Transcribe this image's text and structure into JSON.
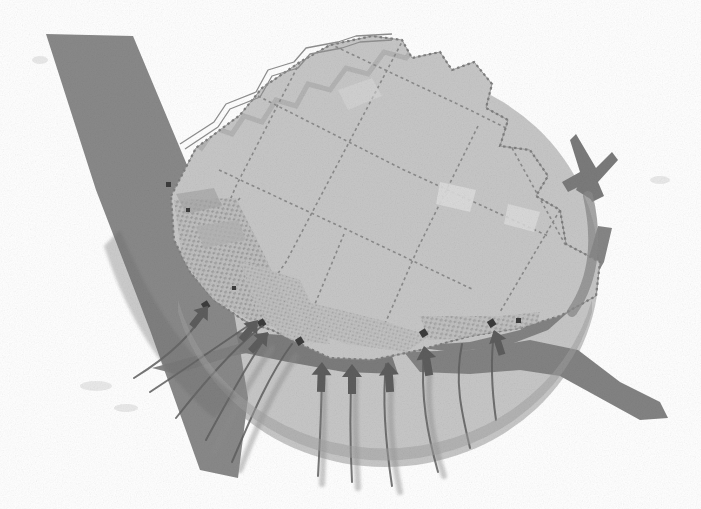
{
  "document": {
    "type": "analytical-urban-map",
    "title": "District Accessibility and Flow Diagram",
    "background_color": "#ffffff",
    "width": 701,
    "height": 509,
    "color_mode": "grayscale"
  },
  "palette": {
    "background": "#ffffff",
    "district_fill": "#c6c6c6",
    "district_fill_light": "#cfcfcf",
    "parcel_outline": "#8e8e8e",
    "corridor_band": "#858585",
    "corridor_band_dark": "#7b7b7b",
    "catchment_circle": "#a9a9a9",
    "flow_arrow": "#6f6f6f",
    "flow_line": "#5e5e5e",
    "building_texture": "#b0b0b0",
    "road_line": "#9a9a9a",
    "marker_dark": "#3a3a3a"
  },
  "layers": [
    {
      "id": "corridor",
      "name": "Transport / Water Corridor",
      "color": "#858585",
      "opacity": 0.95
    },
    {
      "id": "catchment",
      "name": "Catchment Radius Circle",
      "color": "#a9a9a9",
      "opacity": 0.72
    },
    {
      "id": "district",
      "name": "District Parcel Block",
      "color": "#c6c6c6",
      "opacity": 1
    },
    {
      "id": "flows",
      "name": "Movement Flow Arrows",
      "color": "#6f6f6f",
      "opacity": 0.9
    }
  ],
  "catchment": {
    "label": "catchment-circle",
    "center_x": 385,
    "center_y": 270,
    "radius_x": 213,
    "radius_y": 198,
    "fill": "#a9a9a9",
    "opacity": 0.7
  },
  "corridors": [
    {
      "id": "corridor-northwest",
      "name": "North-west corridor band",
      "description": "Wide diagonal dark band entering from upper left running to lower centre",
      "fill": "#858585"
    },
    {
      "id": "corridor-south-east",
      "name": "South-east corridor band",
      "description": "Dark band exiting lower right of the district",
      "fill": "#7e7e7e"
    },
    {
      "id": "corridor-waterfront",
      "name": "Waterfront edge band",
      "description": "Dark band tracing the southern waterfront edge",
      "fill": "#7b7b7b"
    }
  ],
  "parcels": [
    {
      "id": "parcel-01",
      "name": "North block"
    },
    {
      "id": "parcel-02",
      "name": "North-east block"
    },
    {
      "id": "parcel-03",
      "name": "East block"
    },
    {
      "id": "parcel-04",
      "name": "Central block"
    },
    {
      "id": "parcel-05",
      "name": "Central-south block"
    },
    {
      "id": "parcel-06",
      "name": "West block"
    },
    {
      "id": "parcel-07",
      "name": "South-west block"
    },
    {
      "id": "parcel-08",
      "name": "South block"
    },
    {
      "id": "parcel-09",
      "name": "South-east block"
    },
    {
      "id": "parcel-10",
      "name": "Harbour block"
    }
  ],
  "flow_arrows": [
    {
      "id": "flow-1",
      "name": "inbound-flow-west",
      "direction": "north-east",
      "weight": "thin"
    },
    {
      "id": "flow-2",
      "name": "inbound-flow-south-west",
      "direction": "north-east",
      "weight": "thin"
    },
    {
      "id": "flow-3",
      "name": "inbound-flow-south-west-2",
      "direction": "north",
      "weight": "thin"
    },
    {
      "id": "flow-4",
      "name": "inbound-flow-south-a",
      "direction": "north",
      "weight": "thin"
    },
    {
      "id": "flow-5",
      "name": "inbound-flow-south-b",
      "direction": "north",
      "weight": "thin"
    },
    {
      "id": "flow-6",
      "name": "inbound-flow-south-c",
      "direction": "north",
      "weight": "thin"
    },
    {
      "id": "flow-7",
      "name": "inbound-flow-south-east",
      "direction": "north-west",
      "weight": "thin"
    },
    {
      "id": "flow-8",
      "name": "inbound-flow-east-major",
      "direction": "west",
      "weight": "thick"
    }
  ],
  "roads": [
    {
      "id": "road-north-edge",
      "name": "Northern boundary road",
      "style": "double-line"
    }
  ],
  "markers": [
    {
      "id": "marker-a",
      "name": "access-point-west"
    },
    {
      "id": "marker-b",
      "name": "access-point-south-west"
    },
    {
      "id": "marker-c",
      "name": "access-point-south"
    },
    {
      "id": "marker-d",
      "name": "access-point-south-east"
    },
    {
      "id": "marker-e",
      "name": "access-point-east"
    }
  ]
}
